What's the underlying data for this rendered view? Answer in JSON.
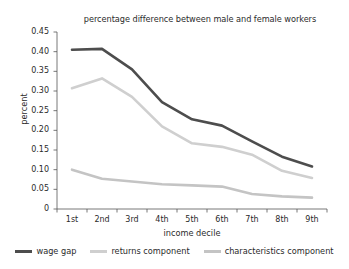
{
  "chart_data": {
    "type": "line",
    "title": "percentage difference between male and female workers",
    "xlabel": "income decile",
    "ylabel": "percent",
    "categories": [
      "1st",
      "2nd",
      "3rd",
      "4th",
      "5th",
      "6th",
      "7th",
      "8th",
      "9th"
    ],
    "ylim": [
      0,
      0.45
    ],
    "yticks": [
      0,
      0.05,
      0.1,
      0.15,
      0.2,
      0.25,
      0.3,
      0.35,
      0.4,
      0.45
    ],
    "ytick_labels": [
      "0",
      "0.05",
      "0.10",
      "0.15",
      "0.20",
      "0.25",
      "0.30",
      "0.35",
      "0.40",
      "0.45"
    ],
    "grid": false,
    "legend_position": "bottom",
    "series": [
      {
        "name": "wage gap",
        "color": "#4d4d4d",
        "values": [
          0.405,
          0.407,
          0.355,
          0.272,
          0.228,
          0.212,
          0.172,
          0.133,
          0.108
        ]
      },
      {
        "name": "returns component",
        "color": "#cfcfcf",
        "values": [
          0.307,
          0.332,
          0.285,
          0.21,
          0.167,
          0.158,
          0.138,
          0.097,
          0.079
        ]
      },
      {
        "name": "characteristics component",
        "color": "#c4c4c4",
        "values": [
          0.1,
          0.077,
          0.07,
          0.063,
          0.06,
          0.057,
          0.038,
          0.032,
          0.029
        ]
      }
    ]
  },
  "axis": {
    "line_color": "#555555"
  }
}
